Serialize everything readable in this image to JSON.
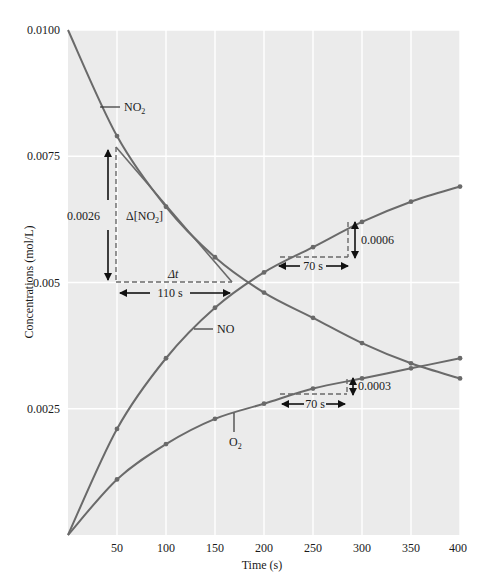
{
  "chart_data": {
    "type": "line",
    "title": "",
    "xlabel": "Time (s)",
    "ylabel": "Concentrations (mol/L)",
    "xlim": [
      0,
      400
    ],
    "ylim": [
      0,
      0.01
    ],
    "grid": true,
    "legend": "inline labels",
    "x": [
      0,
      50,
      100,
      150,
      200,
      250,
      300,
      350,
      400
    ],
    "x_tick_labels": [
      "50",
      "100",
      "150",
      "200",
      "250",
      "300",
      "350",
      "400"
    ],
    "y_tick_labels": [
      "0.0025",
      "0.005",
      "0.0075",
      "0.0100"
    ],
    "y_ticks": [
      0.0025,
      0.005,
      0.0075,
      0.01
    ],
    "series": [
      {
        "name": "NO2",
        "label": "NO",
        "label_sub": "2",
        "values": [
          0.01,
          0.0079,
          0.0065,
          0.0055,
          0.0048,
          0.0043,
          0.0038,
          0.0034,
          0.0031
        ]
      },
      {
        "name": "NO",
        "label": "NO",
        "label_sub": "",
        "values": [
          0.0,
          0.0021,
          0.0035,
          0.0045,
          0.0052,
          0.0057,
          0.0062,
          0.0066,
          0.0069
        ]
      },
      {
        "name": "O2",
        "label": "O",
        "label_sub": "2",
        "values": [
          0.0,
          0.0011,
          0.0018,
          0.0023,
          0.0026,
          0.0029,
          0.0031,
          0.0033,
          0.0035
        ]
      }
    ],
    "annotations": {
      "no2_tangent": {
        "delta_conc_label": "0.0026",
        "delta_label": "Δ[NO",
        "delta_label_sub": "2",
        "delta_label_close": "]",
        "delta_t_symbol": "Δt",
        "delta_t_label": "110 s"
      },
      "no_slope": {
        "delta_conc_label": "0.0006",
        "delta_t_label": "70 s"
      },
      "o2_slope": {
        "delta_conc_label": "0.0003",
        "delta_t_label": "70 s"
      }
    }
  },
  "colors": {
    "plot_background": "#ebebeb",
    "gridline": "#ffffff",
    "curve": "#6a6a6a",
    "text": "#1a1a1a"
  }
}
